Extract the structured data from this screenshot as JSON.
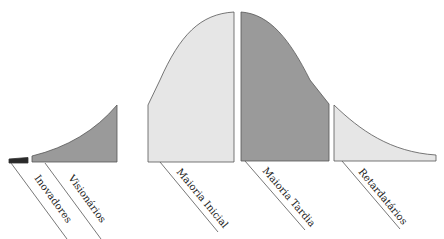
{
  "title_partial": "",
  "diagram": {
    "type": "diffusion-of-innovations-curve",
    "colors": {
      "innovators": "#2a2a2a",
      "light_fill": "#e6e6e6",
      "dark_fill": "#9a9a9a",
      "stroke": "#555555"
    },
    "segments": [
      {
        "id": "innovators",
        "label": "Inovadores"
      },
      {
        "id": "early-adopters",
        "label": "Visionários"
      },
      {
        "id": "early-majority",
        "label": "Maioria Inicial"
      },
      {
        "id": "late-majority",
        "label": "Maioria Tardia"
      },
      {
        "id": "laggards",
        "label": "Retardatários"
      }
    ]
  }
}
